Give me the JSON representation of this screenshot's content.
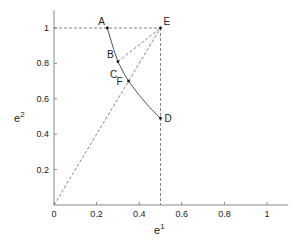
{
  "diagram": {
    "xlabel": "e",
    "xlabel_sup": "1",
    "ylabel": "e",
    "ylabel_sup": "2",
    "xlim": [
      0,
      1.1
    ],
    "ylim": [
      0,
      1.1
    ],
    "xticks": [
      {
        "v": 0,
        "label": "0"
      },
      {
        "v": 0.2,
        "label": "0.2"
      },
      {
        "v": 0.4,
        "label": "0.4"
      },
      {
        "v": 0.6,
        "label": "0.6"
      },
      {
        "v": 0.8,
        "label": "0.8"
      },
      {
        "v": 1,
        "label": "1"
      }
    ],
    "yticks": [
      {
        "v": 0.2,
        "label": "0.2"
      },
      {
        "v": 0.4,
        "label": "0.4"
      },
      {
        "v": 0.6,
        "label": "0.6"
      },
      {
        "v": 0.8,
        "label": "0.8"
      },
      {
        "v": 1,
        "label": "1"
      }
    ],
    "points": [
      {
        "name": "A",
        "x": 0.25,
        "y": 1.0,
        "dx": -9,
        "dy": -3,
        "marker": true
      },
      {
        "name": "E",
        "x": 0.5,
        "y": 1.0,
        "dx": 3,
        "dy": -3,
        "marker": true
      },
      {
        "name": "B",
        "x": 0.3,
        "y": 0.81,
        "dx": -11,
        "dy": -4,
        "marker": true
      },
      {
        "name": "C",
        "x": 0.31,
        "y": 0.76,
        "dx": -10,
        "dy": 8,
        "marker": false
      },
      {
        "name": "F",
        "x": 0.35,
        "y": 0.7,
        "dx": -12,
        "dy": 4,
        "marker": true
      },
      {
        "name": "D",
        "x": 0.5,
        "y": 0.49,
        "dx": 4,
        "dy": 4,
        "marker": true
      }
    ],
    "curve": [
      [
        0.25,
        1.0
      ],
      [
        0.28,
        0.88
      ],
      [
        0.3,
        0.81
      ],
      [
        0.33,
        0.74
      ],
      [
        0.35,
        0.7
      ],
      [
        0.4,
        0.62
      ],
      [
        0.45,
        0.55
      ],
      [
        0.5,
        0.49
      ]
    ],
    "dashed_lines": [
      [
        [
          0,
          1
        ],
        [
          0.5,
          1
        ]
      ],
      [
        [
          0.5,
          1
        ],
        [
          0.5,
          0
        ]
      ],
      [
        [
          0,
          0
        ],
        [
          0.5,
          1
        ]
      ],
      [
        [
          0.3,
          0.81
        ],
        [
          0.5,
          1
        ]
      ]
    ]
  }
}
